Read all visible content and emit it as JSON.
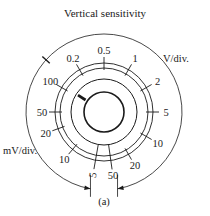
{
  "diagram": {
    "title": "Vertical sensitivity",
    "caption": "(a)",
    "unit_labels": {
      "volts": "V/div.",
      "millivolts": "mV/div."
    },
    "dial": {
      "center": [
        104,
        112
      ],
      "rings": [
        {
          "name": "knob-inner",
          "r": 20,
          "stroke_width": 1.6
        },
        {
          "name": "knob-skirt",
          "r": 33,
          "stroke_width": 1.0
        },
        {
          "name": "scale-inner",
          "r": 44,
          "stroke_width": 0.9
        },
        {
          "name": "scale-outer",
          "r": 49,
          "stroke_width": 0.9
        }
      ],
      "outer_arc": {
        "r": 78,
        "gap_start_deg": 100,
        "gap_end_deg": 80
      },
      "pointer_deg": 213,
      "outer_marker_deg": 222
    },
    "scale_marks": [
      {
        "label": "0.5",
        "unit": "V/div.",
        "angle": 270
      },
      {
        "label": "1",
        "unit": "V/div.",
        "angle": 300
      },
      {
        "label": "2",
        "unit": "V/div.",
        "angle": 330
      },
      {
        "label": "5",
        "unit": "V/div.",
        "angle": 0
      },
      {
        "label": "10",
        "unit": "V/div.",
        "angle": 30
      },
      {
        "label": "20",
        "unit": "V/div.",
        "angle": 60
      },
      {
        "label": "50",
        "unit": "mV/div.",
        "angle": 82
      },
      {
        "label": "5",
        "unit": "mV/div.",
        "angle": 100
      },
      {
        "label": "10",
        "unit": "mV/div.",
        "angle": 130
      },
      {
        "label": "20",
        "unit": "mV/div.",
        "angle": 160
      },
      {
        "label": "50",
        "unit": "mV/div.",
        "angle": 180
      },
      {
        "label": "100",
        "unit": "mV/div.",
        "angle": 210
      },
      {
        "label": "0.2",
        "unit": "V/div.",
        "angle": 240
      }
    ]
  }
}
